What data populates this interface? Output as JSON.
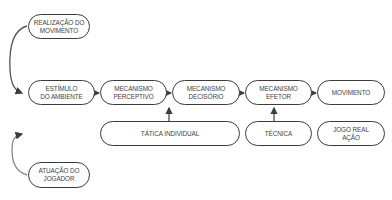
{
  "diagram": {
    "top_box": "REALIZAÇÃO DO\nMOVIMENTO",
    "bottom_left_box": "ATUAÇÃO DO\nJOGADOR",
    "main_row": [
      "ESTÍMULO\nDO AMBIENTE",
      "MECANISMO\nPERCEPTIVO",
      "MECANISMO\nDECISÓRIO",
      "MECANISMO\nEFETOR",
      "MOVIMENTO"
    ],
    "lower_row": [
      "TÁTICA INDIVIDUAL",
      "TÉCNICA",
      "JOGO REAL\nAÇÃO"
    ],
    "colors": {
      "stroke": "#3c3c3c",
      "text": "#444444",
      "background": "#ffffff"
    }
  }
}
